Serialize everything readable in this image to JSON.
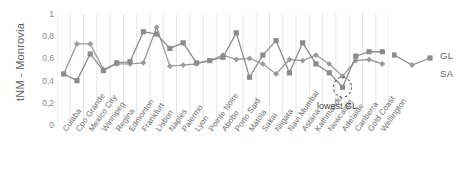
{
  "chart_data": {
    "type": "line",
    "title": "",
    "xlabel": "",
    "ylabel": "tNM - Monrovia",
    "ylim": [
      0,
      1
    ],
    "yticks": [
      "0",
      "0,2",
      "0,4",
      "0,6",
      "0,8",
      "1"
    ],
    "ytick_values": [
      0,
      0.2,
      0.4,
      0.6,
      0.8,
      1
    ],
    "grid": "vertical",
    "legend_position": "right",
    "categories": [
      "Cuiaba",
      "Cpo Grande",
      "Mexico City",
      "Winnipeg",
      "Regina",
      "Edmonton",
      "Frankfurt",
      "Lisbon",
      "Naples",
      "Palermo",
      "Lyon",
      "Pointe Noire",
      "Abobo",
      "Porto Said",
      "Matola",
      "Sakai",
      "Niigata",
      "Navi Mumbai",
      "Astana",
      "Kathmandu",
      "Newcastle",
      "Adelaide",
      "Canberra",
      "Gold Coast",
      "Wellington"
    ],
    "series": [
      {
        "name": "GL",
        "marker": "square",
        "color": "#8c8c8c",
        "values": [
          0.46,
          0.4,
          0.64,
          0.49,
          0.56,
          0.57,
          0.84,
          0.82,
          0.69,
          0.74,
          0.56,
          0.58,
          0.61,
          0.83,
          0.43,
          0.63,
          0.76,
          0.47,
          0.74,
          0.55,
          0.47,
          0.34,
          0.62,
          0.66,
          0.66
        ]
      },
      {
        "name": "SA",
        "marker": "diamond",
        "color": "#9a9a9a",
        "values": [
          0.46,
          0.73,
          0.73,
          0.5,
          0.55,
          0.55,
          0.56,
          0.88,
          0.53,
          0.54,
          0.55,
          0.58,
          0.63,
          0.59,
          0.6,
          0.55,
          0.46,
          0.59,
          0.58,
          0.63,
          0.55,
          0.44,
          0.58,
          0.59,
          0.55
        ]
      }
    ],
    "annotations": [
      {
        "text": "lowest GL",
        "target_category": "Adelaide",
        "target_series": "GL"
      }
    ]
  },
  "legend": {
    "gl": "GL",
    "sa": "SA"
  }
}
